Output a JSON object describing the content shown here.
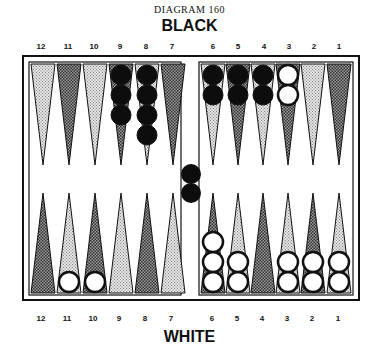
{
  "caption": "DIAGRAM 160",
  "top_player": "BLACK",
  "bottom_player": "WHITE",
  "top_numbers": [
    "12",
    "11",
    "10",
    "9",
    "8",
    "7",
    "6",
    "5",
    "4",
    "3",
    "2",
    "1"
  ],
  "bottom_numbers": [
    "12",
    "11",
    "10",
    "9",
    "8",
    "7",
    "6",
    "5",
    "4",
    "3",
    "2",
    "1"
  ],
  "colors": {
    "board_line": "#111111",
    "dark_point": "#6a6a6a",
    "light_point": "#c4c4c4",
    "black_checker": "#0d0d0d",
    "white_checker": "#ffffff"
  },
  "position": {
    "black_top": {
      "9": 3,
      "8": 4,
      "6": 2,
      "5": 2,
      "4": 2
    },
    "white_top": {
      "3": 2
    },
    "white_bottom": {
      "11": 1,
      "10": 1,
      "6": 3,
      "5": 2,
      "3": 2,
      "2": 2,
      "1": 2
    },
    "black_bar": 2
  }
}
